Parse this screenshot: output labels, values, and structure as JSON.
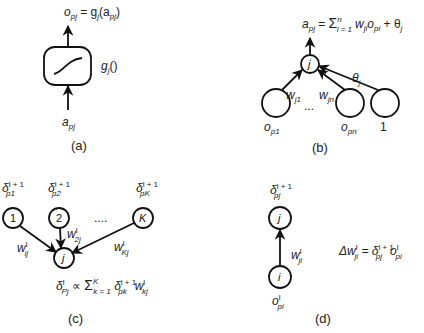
{
  "panels": {
    "a": {
      "caption": "(a)",
      "output_label": "o",
      "output_sub": "pj",
      "output_eq": " = g",
      "output_eq_sub": "j",
      "output_eq_arg": "(a",
      "output_eq_arg_sub": "pj",
      "output_eq_close": ")",
      "function_label": "g",
      "function_sub": "j",
      "function_paren": "()",
      "input_label": "a",
      "input_sub": "pj",
      "icon": "sigmoid-activation-box"
    },
    "b": {
      "caption": "(b)",
      "equation": {
        "lhs": "a",
        "lhs_sub": "pj",
        "eq": " = ",
        "sum": "Σ",
        "sum_upper": "n",
        "sum_lower": "i = 1",
        "term_w": "w",
        "term_w_sub": "ji",
        "term_o": "o",
        "term_o_sub": "pi",
        "plus": " + θ",
        "theta_sub": "j"
      },
      "target_node": "j",
      "inputs": [
        {
          "label": "o",
          "sub": "p1",
          "weight": "w",
          "weight_sub": "j1"
        },
        {
          "label": "o",
          "sub": "pn",
          "weight": "w",
          "weight_sub": "jn"
        },
        {
          "label": "1",
          "sub": "",
          "weight": "θ",
          "weight_sub": "j"
        }
      ],
      "ellipsis": "..."
    },
    "c": {
      "caption": "(c)",
      "target_node": "j",
      "sources": [
        {
          "node": "1",
          "delta": "δ",
          "delta_sup": "l + 1",
          "delta_sub": "p1",
          "weight": "w",
          "weight_sup": "l",
          "weight_sub": "ij"
        },
        {
          "node": "2",
          "delta": "δ",
          "delta_sup": "l + 1",
          "delta_sub": "p2",
          "weight": "w",
          "weight_sup": "l",
          "weight_sub": "2j"
        },
        {
          "node": "K",
          "delta": "δ",
          "delta_sup": "l + 1",
          "delta_sub": "pK",
          "weight": "w",
          "weight_sup": "l",
          "weight_sub": "Kj"
        }
      ],
      "ellipsis": "....",
      "equation": {
        "lhs": "δ",
        "lhs_sup": "l",
        "lhs_sub": "Pj",
        "prop": " ∝ ",
        "sum": "Σ",
        "sum_upper": "K",
        "sum_lower": "k = 1",
        "d": " δ",
        "d_sup": "l + 1",
        "d_sub": "pk",
        "w": "w",
        "w_sup": "l",
        "w_sub": "kj"
      }
    },
    "d": {
      "caption": "(d)",
      "top_node": "j",
      "bottom_node": "i",
      "top_label": {
        "sym": "δ",
        "sup": "l + 1",
        "sub": "pj"
      },
      "bottom_label": {
        "sym": "o",
        "sup": "l",
        "sub": "pi"
      },
      "weight": {
        "sym": "w",
        "sup": "l",
        "sub": "ji"
      },
      "equation": {
        "lhs": "Δw",
        "lhs_sup": "l",
        "lhs_sub": "ji",
        "eq": " = δ",
        "d_sup": "l + 1",
        "d_sub": "pj",
        "o": "o",
        "o_sup": "l",
        "o_sub": "pi"
      }
    }
  },
  "colors": {
    "stroke": "#111111",
    "text": "#222222",
    "background": "#ffffff"
  }
}
